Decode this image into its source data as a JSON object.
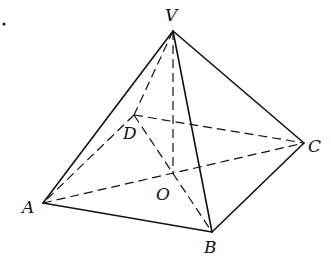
{
  "figure": {
    "points": {
      "V": {
        "label": "V",
        "x": 173,
        "y": 31,
        "lx": 165,
        "ly": 21
      },
      "A": {
        "label": "A",
        "x": 43,
        "y": 203,
        "lx": 22,
        "ly": 213
      },
      "B": {
        "label": "B",
        "x": 212,
        "y": 232,
        "lx": 204,
        "ly": 253
      },
      "C": {
        "label": "C",
        "x": 304,
        "y": 143,
        "lx": 308,
        "ly": 152
      },
      "D": {
        "label": "D",
        "x": 134,
        "y": 115,
        "lx": 123,
        "ly": 139
      },
      "O": {
        "label": "O",
        "x": 173,
        "y": 174,
        "lx": 156,
        "ly": 200
      }
    },
    "solid_edges": [
      [
        "V",
        "A"
      ],
      [
        "V",
        "B"
      ],
      [
        "V",
        "C"
      ],
      [
        "A",
        "B"
      ],
      [
        "B",
        "C"
      ]
    ],
    "dashed_edges": [
      [
        "V",
        "D"
      ],
      [
        "V",
        "O"
      ],
      [
        "D",
        "A"
      ],
      [
        "D",
        "C"
      ],
      [
        "A",
        "C"
      ],
      [
        "D",
        "B"
      ]
    ],
    "stray_dot": {
      "x": 4,
      "y": 24
    }
  }
}
